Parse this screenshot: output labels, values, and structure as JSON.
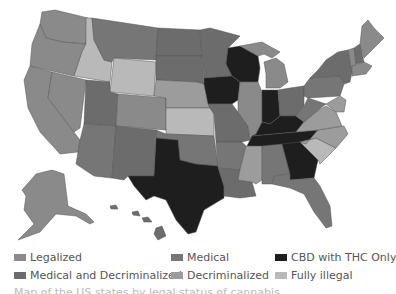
{
  "map": {
    "title": "US map of cannabis legal status by state",
    "colors": {
      "legalized": "#8a8a8a",
      "medical": "#767676",
      "cbd_thc_only": "#1e1e1e",
      "medical_decriminalized": "#6c6c6c",
      "decriminalized": "#9c9c9c",
      "fully_illegal": "#b9b9b9"
    },
    "states": {
      "WA": "legalized",
      "OR": "legalized",
      "CA": "legalized",
      "NV": "legalized",
      "ID": "fully_illegal",
      "MT": "medical",
      "WY": "fully_illegal",
      "UT": "medical_decriminalized",
      "CO": "legalized",
      "AZ": "medical",
      "NM": "medical_decriminalized",
      "ND": "medical_decriminalized",
      "SD": "medical_decriminalized",
      "NE": "decriminalized",
      "KS": "fully_illegal",
      "OK": "medical",
      "TX": "cbd_thc_only",
      "MN": "medical_decriminalized",
      "IA": "cbd_thc_only",
      "MO": "medical_decriminalized",
      "AR": "medical",
      "LA": "medical_decriminalized",
      "WI": "cbd_thc_only",
      "IL": "legalized",
      "MI": "legalized",
      "IN": "cbd_thc_only",
      "OH": "medical_decriminalized",
      "KY": "cbd_thc_only",
      "TN": "cbd_thc_only",
      "MS": "decriminalized",
      "AL": "medical",
      "GA": "cbd_thc_only",
      "FL": "medical",
      "SC": "fully_illegal",
      "NC": "decriminalized",
      "VA": "decriminalized",
      "WV": "medical",
      "PA": "medical",
      "NY": "medical_decriminalized",
      "ME": "legalized",
      "NH": "medical_decriminalized",
      "VT": "legalized",
      "MA": "legalized",
      "AK": "legalized",
      "HI": "medical_decriminalized"
    }
  },
  "legend": {
    "items": [
      {
        "key": "legalized",
        "label": "Legalized",
        "color": "#8a8a8a"
      },
      {
        "key": "medical",
        "label": "Medical",
        "color": "#767676"
      },
      {
        "key": "cbd_thc_only",
        "label": "CBD with THC Only",
        "color": "#1e1e1e"
      },
      {
        "key": "medical_decriminalized",
        "label": "Medical and Decriminalized",
        "color": "#6c6c6c"
      },
      {
        "key": "decriminalized",
        "label": "Decriminalized",
        "color": "#9c9c9c"
      },
      {
        "key": "fully_illegal",
        "label": "Fully illegal",
        "color": "#b9b9b9"
      }
    ]
  },
  "caption": "Map of the US states by legal status of cannabis"
}
